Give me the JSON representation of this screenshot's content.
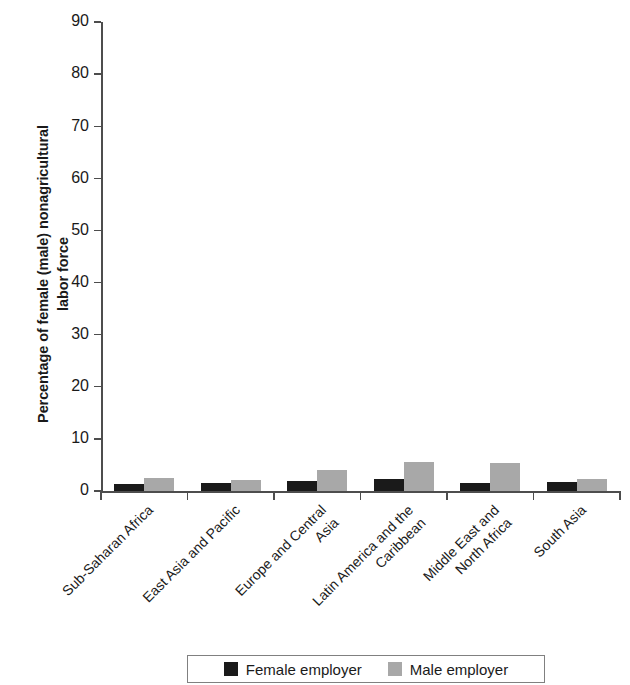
{
  "chart_data": {
    "type": "bar",
    "title": "",
    "xlabel": "",
    "ylabel": "Percentage of female (male) nonagricultural\nlabor force",
    "ylim": [
      0,
      90
    ],
    "ytick_values": [
      0,
      10,
      20,
      30,
      40,
      50,
      60,
      70,
      80,
      90
    ],
    "ytick_labels": [
      "0",
      "10",
      "20",
      "30",
      "40",
      "50",
      "60",
      "70",
      "80",
      "90"
    ],
    "grid": false,
    "legend_position": "bottom",
    "categories": [
      "Sub-Saharan Africa",
      "East Asia and Pacific",
      "Europe and Central\nAsia",
      "Latin America and the\nCaribbean",
      "Middle East and\nNorth Africa",
      "South Asia"
    ],
    "series": [
      {
        "name": "Female employer",
        "color": "#1a1a1a",
        "values": [
          1.3,
          1.5,
          2.0,
          2.4,
          1.5,
          1.8
        ]
      },
      {
        "name": "Male employer",
        "color": "#a8a8a8",
        "values": [
          2.5,
          2.2,
          4.0,
          5.6,
          5.3,
          2.3
        ]
      }
    ]
  },
  "legend": {
    "entries": [
      {
        "label": "Female employer",
        "swatch": "female"
      },
      {
        "label": "Male employer",
        "swatch": "male"
      }
    ]
  }
}
